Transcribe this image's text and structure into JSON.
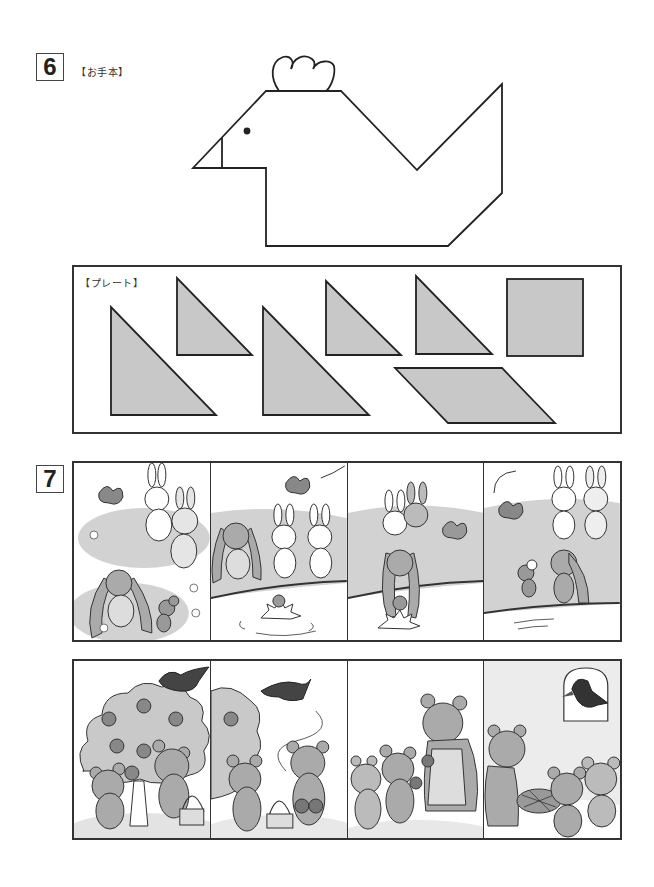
{
  "question6": {
    "number": "6",
    "model_label": "【お手本】",
    "figure": "hen-tangram-silhouette",
    "plate_label": "【プレート】",
    "plates": [
      {
        "shape": "large-right-triangle",
        "id": "p1"
      },
      {
        "shape": "small-right-triangle",
        "id": "p2"
      },
      {
        "shape": "large-right-triangle",
        "id": "p3"
      },
      {
        "shape": "small-right-triangle",
        "id": "p4"
      },
      {
        "shape": "small-right-triangle",
        "id": "p5"
      },
      {
        "shape": "square",
        "id": "p6"
      },
      {
        "shape": "parallelogram",
        "id": "p7"
      }
    ],
    "plate_fill": "#c8c8c8",
    "stroke": "#222222"
  },
  "question7": {
    "number": "7",
    "strips": [
      {
        "story": "rabbits-and-mouse",
        "panels": [
          {
            "scene": "bird-rabbits-mouse-meadow"
          },
          {
            "scene": "mouse-falls-in-pond"
          },
          {
            "scene": "long-eared-rabbit-rescues-mouse"
          },
          {
            "scene": "mouse-thanks-rabbit"
          }
        ]
      },
      {
        "story": "bears-and-crow",
        "panels": [
          {
            "scene": "bears-picking-apples-crow-on-tree"
          },
          {
            "scene": "crow-flies-off-with-apples"
          },
          {
            "scene": "bear-cubs-give-apples-to-mother"
          },
          {
            "scene": "apple-pie-crow-at-window"
          }
        ]
      }
    ]
  }
}
